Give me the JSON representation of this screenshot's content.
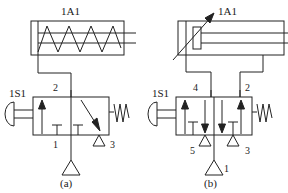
{
  "figure": {
    "title": "",
    "stroke_color": "#222222",
    "background_color": "#ffffff"
  },
  "panels": [
    {
      "id": "a",
      "caption": "(a)",
      "cylinder": {
        "tag": "1A1",
        "type": "single-acting-spring-return",
        "spring": true,
        "ports": 1
      },
      "valve": {
        "tag": "1S1",
        "type": "3/2-way",
        "positions": 2,
        "actuator": "push-button-plunger",
        "return": "spring",
        "ports": [
          {
            "number": "2",
            "position": "top"
          },
          {
            "number": "1",
            "position": "bottom-left"
          },
          {
            "number": "3",
            "position": "bottom-right"
          }
        ]
      },
      "supply": {
        "symbol": "pressure-source-triangle",
        "label": ""
      }
    },
    {
      "id": "b",
      "caption": "(b)",
      "cylinder": {
        "tag": "1A1",
        "type": "double-acting",
        "spring": false,
        "ports": 2,
        "annotation": "adjustable-arrow"
      },
      "valve": {
        "tag": "1S1",
        "type": "5/2-way",
        "positions": 2,
        "actuator": "push-button-plunger",
        "return": "spring",
        "ports": [
          {
            "number": "4",
            "position": "top-left"
          },
          {
            "number": "2",
            "position": "top-right"
          },
          {
            "number": "5",
            "position": "bottom-left"
          },
          {
            "number": "3",
            "position": "bottom-right"
          },
          {
            "number": "1",
            "position": "bottom-center"
          }
        ]
      },
      "supply": {
        "symbol": "pressure-source-triangle",
        "label": "1"
      }
    }
  ]
}
